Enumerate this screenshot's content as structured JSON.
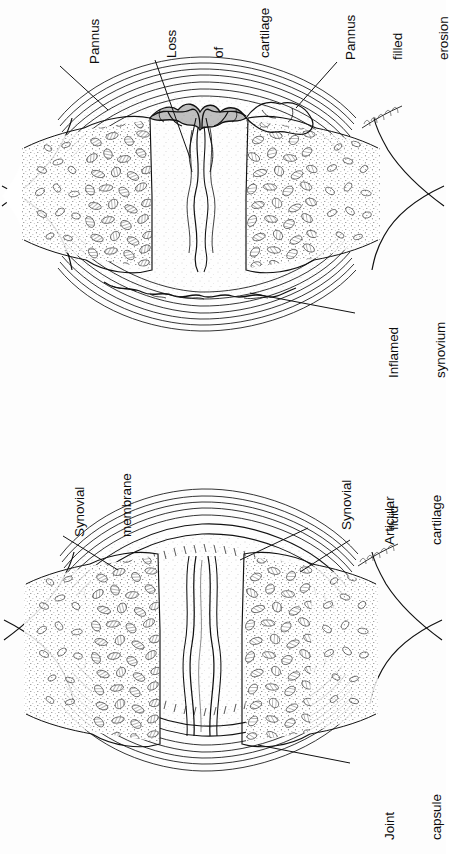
{
  "figure": {
    "title_visible": false,
    "background_color": "#fdfdfd",
    "ink_color": "#111111",
    "orientation_note": "labels rotated 90 degrees counter-clockwise",
    "panels": [
      {
        "id": "diseased-joint",
        "name": "rheumatoid-arthritis-joint",
        "position": "upper",
        "labels": [
          {
            "key": "pannus",
            "text": "Pannus",
            "lines": [
              "Pannus"
            ]
          },
          {
            "key": "loss_of_cartilage",
            "text": "Loss of cartilage",
            "lines": [
              "Loss",
              "of",
              "cartilage"
            ]
          },
          {
            "key": "pannus_filled_erosion",
            "text": "Pannus filled erosion",
            "lines": [
              "Pannus",
              "filled",
              "erosion"
            ]
          },
          {
            "key": "inflamed_synovium",
            "text": "Inflamed synovium",
            "lines": [
              "Inflamed",
              "synovium"
            ]
          }
        ]
      },
      {
        "id": "normal-joint",
        "name": "normal-synovial-joint",
        "position": "lower",
        "labels": [
          {
            "key": "synovial_membrane",
            "text": "Synovial membrane",
            "lines": [
              "Synovial",
              "membrane"
            ]
          },
          {
            "key": "synovial_fluid",
            "text": "Synovial fluid",
            "lines": [
              "Synovial",
              "fluid"
            ]
          },
          {
            "key": "articular_cartilage",
            "text": "Articular cartilage",
            "lines": [
              "Articular",
              "cartilage"
            ]
          },
          {
            "key": "joint_capsule",
            "text": "Joint capsule",
            "lines": [
              "Joint",
              "capsule"
            ]
          }
        ]
      }
    ]
  },
  "labels": {
    "pannus_l1": "Pannus",
    "loss_l1": "Loss",
    "loss_l2": "of",
    "loss_l3": "cartilage",
    "erosion_l1": "Pannus",
    "erosion_l2": "filled",
    "erosion_l3": "erosion",
    "inflamed_l1": "Inflamed",
    "inflamed_l2": "synovium",
    "synmem_l1": "Synovial",
    "synmem_l2": "membrane",
    "synfluid_l1": "Synovial",
    "synfluid_l2": "fluid",
    "artcart_l1": "Articular",
    "artcart_l2": "cartilage",
    "jointcap_l1": "Joint",
    "jointcap_l2": "capsule"
  }
}
